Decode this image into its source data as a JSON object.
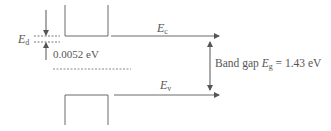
{
  "diagram": {
    "labels": {
      "ed_main": "E",
      "ed_sub": "d",
      "donor_gap": "0.0052 eV",
      "ec_main": "E",
      "ec_sub": "c",
      "ev_main": "E",
      "ev_sub": "v",
      "bandgap_prefix": "Band gap ",
      "bandgap_main": "E",
      "bandgap_sub": "g",
      "bandgap_value": " = 1.43 eV"
    },
    "colors": {
      "line": "#6a6a6a",
      "text": "#555555",
      "background": "#ffffff"
    }
  }
}
